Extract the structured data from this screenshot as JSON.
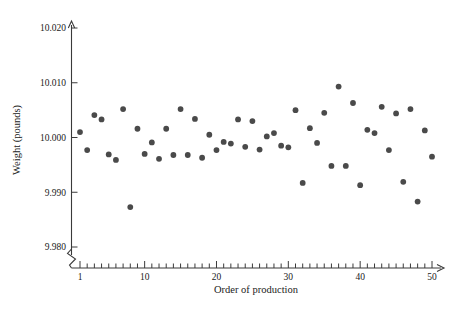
{
  "chart_data": {
    "type": "scatter",
    "title": "",
    "xlabel": "Order of production",
    "ylabel": "Weight (pounds)",
    "xlim": [
      0.2,
      51
    ],
    "ylim": [
      9.98,
      10.02
    ],
    "grid": false,
    "legend": null,
    "y_ticks": [
      "10.020",
      "10.010",
      "10.000",
      "9.990",
      "9.980"
    ],
    "y_tick_values": [
      10.02,
      10.01,
      10.0,
      9.99,
      9.98
    ],
    "x_ticks": [
      "1",
      "10",
      "20",
      "30",
      "40",
      "50"
    ],
    "x_tick_values": [
      1,
      10,
      20,
      30,
      40,
      50
    ],
    "x_minor_tick_step": 1,
    "axis_break": true,
    "marker": "circle",
    "marker_color": "#4a4a4a",
    "marker_size": 4.2,
    "x": [
      1,
      2,
      3,
      4,
      5,
      6,
      7,
      8,
      9,
      10,
      11,
      12,
      13,
      14,
      15,
      16,
      17,
      18,
      19,
      20,
      21,
      22,
      23,
      24,
      25,
      26,
      27,
      28,
      29,
      30,
      31,
      32,
      33,
      34,
      35,
      36,
      37,
      38,
      39,
      40,
      41,
      42,
      43,
      44,
      45,
      46,
      47,
      48,
      49,
      50
    ],
    "values": [
      10.001,
      9.9977,
      10.0041,
      10.0033,
      9.9969,
      9.9959,
      10.0052,
      9.9873,
      10.0016,
      9.997,
      9.9991,
      9.9961,
      10.0016,
      9.9968,
      10.0052,
      9.9968,
      10.0034,
      9.9963,
      10.0005,
      9.9977,
      9.9992,
      9.9989,
      10.0033,
      9.9983,
      10.003,
      9.9978,
      10.0002,
      10.0008,
      9.9985,
      9.9982,
      10.005,
      9.9917,
      10.0017,
      9.999,
      10.0045,
      9.9948,
      10.0093,
      9.9948,
      10.0063,
      9.9913,
      10.0014,
      10.0008,
      10.0056,
      9.9977,
      10.0044,
      9.9919,
      10.0052,
      9.9883,
      10.0013,
      9.9965
    ]
  }
}
